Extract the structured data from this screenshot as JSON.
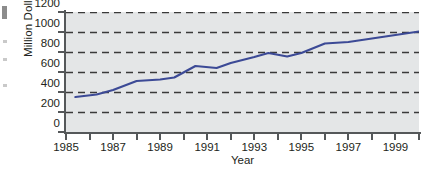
{
  "chart_data": {
    "type": "line",
    "title": "",
    "subtitle": "",
    "xlabel": "Year",
    "ylabel": "Million Dollars",
    "xlim": [
      1985,
      2000
    ],
    "ylim": [
      0,
      1200
    ],
    "ytick_labels": [
      "1200",
      "1000",
      "800",
      "600",
      "400",
      "200",
      "0"
    ],
    "ytick_values": [
      1200,
      1000,
      800,
      600,
      400,
      200,
      0
    ],
    "xtick_labels": [
      "1985",
      "1987",
      "1989",
      "1991",
      "1993",
      "1995",
      "1997",
      "1999"
    ],
    "xtick_values": [
      1985,
      1987,
      1989,
      1991,
      1993,
      1995,
      1997,
      1999
    ],
    "xtick_minor_values": [
      1986,
      1988,
      1990,
      1992,
      1994,
      1996,
      1998,
      2000
    ],
    "grid": "horizontal-dashed",
    "grid_color": "#3a3a3a",
    "plot_background": "#e4e6e7",
    "legend": "none",
    "series": [
      {
        "name": "Million Dollars",
        "color": "#3c4a96",
        "line_width": 2.2,
        "x": [
          1985.4,
          1986.3,
          1987.0,
          1988.0,
          1989.0,
          1989.6,
          1990.5,
          1991.4,
          1992.0,
          1993.0,
          1993.6,
          1994.4,
          1995.0,
          1996.0,
          1997.0,
          1998.0,
          1999.0,
          2000.0
        ],
        "y": [
          350,
          375,
          420,
          510,
          525,
          545,
          660,
          640,
          690,
          750,
          790,
          755,
          790,
          885,
          900,
          935,
          970,
          1005
        ],
        "values_by_year": [
          {
            "year": 1985,
            "value": 350
          },
          {
            "year": 1986,
            "value": 375
          },
          {
            "year": 1987,
            "value": 420
          },
          {
            "year": 1988,
            "value": 510
          },
          {
            "year": 1989,
            "value": 525
          },
          {
            "year": 1990,
            "value": 660
          },
          {
            "year": 1991,
            "value": 640
          },
          {
            "year": 1992,
            "value": 690
          },
          {
            "year": 1993,
            "value": 790
          },
          {
            "year": 1994,
            "value": 755
          },
          {
            "year": 1995,
            "value": 790
          },
          {
            "year": 1996,
            "value": 885
          },
          {
            "year": 1997,
            "value": 900
          },
          {
            "year": 1998,
            "value": 935
          },
          {
            "year": 1999,
            "value": 970
          },
          {
            "year": 2000,
            "value": 1005
          }
        ]
      }
    ]
  }
}
